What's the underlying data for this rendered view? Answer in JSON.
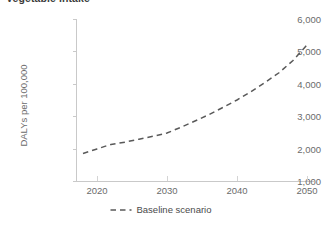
{
  "chart_data": {
    "type": "line",
    "title": "Vegetable intake",
    "xlabel": "",
    "ylabel": "DALYs per 100,000",
    "xlim": [
      2017,
      2051
    ],
    "ylim": [
      1000,
      6000
    ],
    "grid": false,
    "legend_position": "bottom-center",
    "xticks": [
      "2020",
      "2030",
      "2040",
      "2050"
    ],
    "xtick_values": [
      2020,
      2030,
      2040,
      2050
    ],
    "yticks": [
      "1,000",
      "2,000",
      "3,000",
      "4,000",
      "5,000",
      "6,000"
    ],
    "ytick_values": [
      1000,
      2000,
      3000,
      4000,
      5000,
      6000
    ],
    "series": [
      {
        "name": "Baseline scenario",
        "style": "dashed",
        "color": "#595959",
        "x": [
          2018,
          2020,
          2022,
          2024,
          2026,
          2028,
          2030,
          2032,
          2034,
          2036,
          2038,
          2040,
          2042,
          2044,
          2046,
          2048,
          2050
        ],
        "values": [
          1850,
          1990,
          2130,
          2200,
          2290,
          2380,
          2480,
          2660,
          2850,
          3050,
          3270,
          3500,
          3760,
          4040,
          4340,
          4720,
          5200
        ]
      }
    ]
  },
  "legend": {
    "entries": [
      {
        "label": "Baseline scenario",
        "marker": "dashed-line",
        "color": "#595959"
      }
    ]
  },
  "axes": {
    "y_axis_title": "DALYs per 100,000",
    "x_axis_title": ""
  },
  "colors": {
    "series_line": "#595959",
    "axis": "#c9c9c9",
    "tick_text": "#6b6b6b",
    "title_text": "#3b3b3b",
    "background": "#ffffff"
  }
}
